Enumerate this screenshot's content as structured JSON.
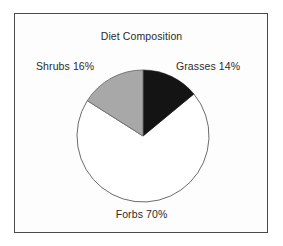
{
  "chart_data": {
    "type": "pie",
    "title": "Diet Composition",
    "xlabel": "",
    "ylabel": "",
    "categories": [
      "Grasses",
      "Shrubs",
      "Forbs"
    ],
    "values": [
      14,
      16,
      70
    ],
    "unit": "%",
    "labels": [
      "Grasses 14%",
      "Shrubs 16%",
      "Forbs 70%"
    ],
    "slice_colors": [
      "#141414",
      "#a8a8a8",
      "#ffffff"
    ],
    "outline_color": "#5a5a5a",
    "start_angle_deg": 0,
    "direction": "clockwise",
    "legend": "none",
    "grid": false,
    "slices": [
      {
        "name": "Grasses",
        "value": 14,
        "label": "Grasses 14%",
        "color": "#141414",
        "start_deg": 0,
        "end_deg": 50.4
      },
      {
        "name": "Forbs",
        "value": 70,
        "label": "Forbs 70%",
        "color": "#ffffff",
        "start_deg": 50.4,
        "end_deg": 302.4
      },
      {
        "name": "Shrubs",
        "value": 16,
        "label": "Shrubs 16%",
        "color": "#a8a8a8",
        "start_deg": 302.4,
        "end_deg": 360
      }
    ]
  },
  "figure": {
    "title": "Diet Composition",
    "frame_color": "#4a4a4a",
    "background_color": "#fdfdfd"
  },
  "labels": {
    "shrubs": "Shrubs 16%",
    "grasses": "Grasses 14%",
    "forbs": "Forbs 70%"
  }
}
